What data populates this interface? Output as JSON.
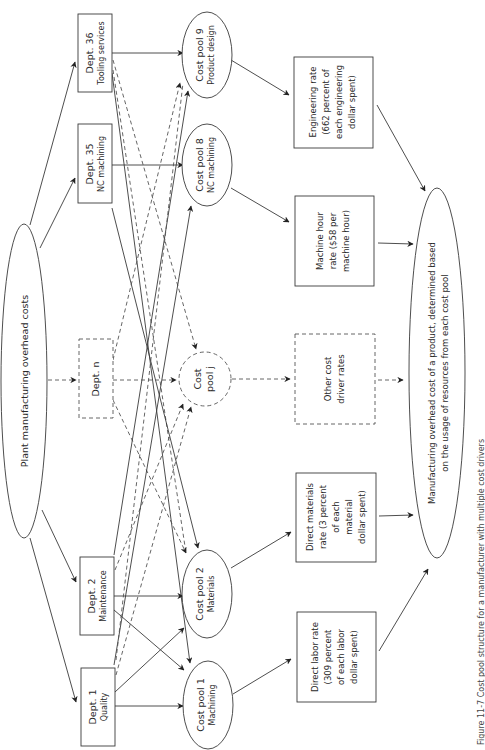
{
  "diagram": {
    "source": {
      "label": "Plant manufacturing overhead costs"
    },
    "departments": [
      {
        "id": "dept36",
        "title": "Dept. 36",
        "subtitle": "Tooling services",
        "dashed": false
      },
      {
        "id": "dept35",
        "title": "Dept. 35",
        "subtitle": "NC machining",
        "dashed": false
      },
      {
        "id": "deptn",
        "title": "Dept. n",
        "subtitle": "",
        "dashed": true
      },
      {
        "id": "dept2",
        "title": "Dept. 2",
        "subtitle": "Maintenance",
        "dashed": false
      },
      {
        "id": "dept1",
        "title": "Dept. 1",
        "subtitle": "Quality",
        "dashed": false
      }
    ],
    "cost_pools": [
      {
        "id": "pool9",
        "title": "Cost pool 9",
        "subtitle": "Product design",
        "dashed": false
      },
      {
        "id": "pool8",
        "title": "Cost pool 8",
        "subtitle": "NC machining",
        "dashed": false
      },
      {
        "id": "poolj",
        "title": "Cost",
        "subtitle": "pool j",
        "dashed": true
      },
      {
        "id": "pool2",
        "title": "Cost pool 2",
        "subtitle": "Materials",
        "dashed": false
      },
      {
        "id": "pool1",
        "title": "Cost pool 1",
        "subtitle": "Machining",
        "dashed": false
      }
    ],
    "rates": [
      {
        "id": "engineering",
        "lines": [
          "Engineering rate",
          "(662 percent of",
          "each engineering",
          "dollar spent)"
        ],
        "dashed": false
      },
      {
        "id": "machine",
        "lines": [
          "Machine hour",
          "rate ($58 per",
          "machine hour)"
        ],
        "dashed": false
      },
      {
        "id": "other",
        "lines": [
          "Other cost",
          "driver rates"
        ],
        "dashed": true
      },
      {
        "id": "materials",
        "lines": [
          "Direct materials",
          "rate (3 percent",
          "of each",
          "material",
          "dollar spent)"
        ],
        "dashed": false
      },
      {
        "id": "labor",
        "lines": [
          "Direct labor rate",
          "(309 percent",
          "of each labor",
          "dollar spent)"
        ],
        "dashed": false
      }
    ],
    "result": {
      "lines": [
        "Manufacturing overhead cost of a product, determined based",
        "on the usage of resources from each cost pool"
      ]
    },
    "connections": [
      {
        "from": "source",
        "to": "dept36",
        "style": "solid"
      },
      {
        "from": "source",
        "to": "dept35",
        "style": "solid"
      },
      {
        "from": "source",
        "to": "deptn",
        "style": "dashed"
      },
      {
        "from": "source",
        "to": "dept2",
        "style": "solid"
      },
      {
        "from": "source",
        "to": "dept1",
        "style": "solid"
      },
      {
        "from": "dept36",
        "to": "pool9",
        "style": "solid"
      },
      {
        "from": "dept36",
        "to": "pool1",
        "style": "solid"
      },
      {
        "from": "dept36",
        "to": "poolj",
        "style": "dashed"
      },
      {
        "from": "dept36",
        "to": "pool2",
        "style": "dashed"
      },
      {
        "from": "dept35",
        "to": "pool8",
        "style": "solid"
      },
      {
        "from": "dept35",
        "to": "pool2",
        "style": "solid"
      },
      {
        "from": "deptn",
        "to": "poolj",
        "style": "dashed"
      },
      {
        "from": "deptn",
        "to": "pool9",
        "style": "dashed"
      },
      {
        "from": "deptn",
        "to": "pool2",
        "style": "dashed"
      },
      {
        "from": "dept2",
        "to": "pool2",
        "style": "solid"
      },
      {
        "from": "dept2",
        "to": "pool1",
        "style": "solid"
      },
      {
        "from": "dept2",
        "to": "pool9",
        "style": "solid"
      },
      {
        "from": "dept2",
        "to": "poolj",
        "style": "dashed"
      },
      {
        "from": "dept1",
        "to": "pool1",
        "style": "solid"
      },
      {
        "from": "dept1",
        "to": "pool2",
        "style": "solid"
      },
      {
        "from": "dept1",
        "to": "pool8",
        "style": "solid"
      },
      {
        "from": "dept1",
        "to": "poolj",
        "style": "dashed"
      },
      {
        "from": "dept1",
        "to": "pool9",
        "style": "dashed"
      },
      {
        "from": "pool9",
        "to": "engineering",
        "style": "solid"
      },
      {
        "from": "pool8",
        "to": "machine",
        "style": "solid"
      },
      {
        "from": "poolj",
        "to": "other",
        "style": "dashed"
      },
      {
        "from": "pool2",
        "to": "materials",
        "style": "solid"
      },
      {
        "from": "pool1",
        "to": "labor",
        "style": "solid"
      },
      {
        "from": "engineering",
        "to": "result",
        "style": "solid"
      },
      {
        "from": "machine",
        "to": "result",
        "style": "solid"
      },
      {
        "from": "other",
        "to": "result",
        "style": "dashed"
      },
      {
        "from": "materials",
        "to": "result",
        "style": "solid"
      },
      {
        "from": "labor",
        "to": "result",
        "style": "solid"
      }
    ],
    "caption": "Figure 11-7 Cost pool structure for a manufacturer with multiple cost drivers"
  }
}
